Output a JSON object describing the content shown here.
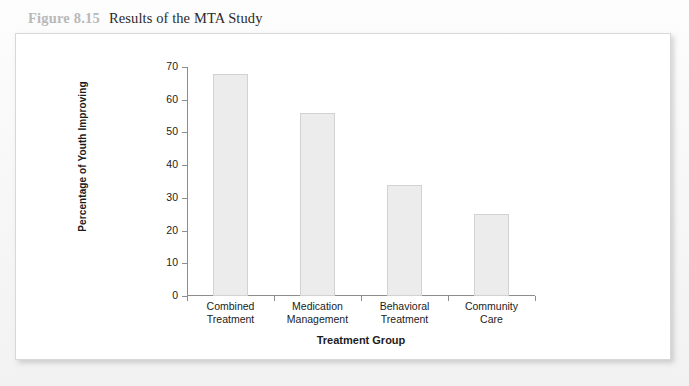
{
  "caption": {
    "number": "Figure 8.15",
    "title": "Results of the MTA Study"
  },
  "chart_data": {
    "type": "bar",
    "title": "Results of the MTA Study",
    "xlabel": "Treatment Group",
    "ylabel": "Percentage of Youth Improving",
    "categories": [
      "Combined Treatment",
      "Medication Management",
      "Behavioral Treatment",
      "Community Care"
    ],
    "category_lines": [
      [
        "Combined",
        "Treatment"
      ],
      [
        "Medication",
        "Management"
      ],
      [
        "Behavioral",
        "Treatment"
      ],
      [
        "Community",
        "Care"
      ]
    ],
    "values": [
      68,
      56,
      34,
      25
    ],
    "ylim": [
      0,
      70
    ],
    "yticks": [
      0,
      10,
      20,
      30,
      40,
      50,
      60,
      70
    ],
    "ytick_labels": [
      "0",
      "10",
      "20",
      "30",
      "40",
      "50",
      "60",
      "70"
    ],
    "grid": false,
    "legend": false,
    "bar_fill": "#ececec",
    "bar_border": "#d2d2d2",
    "axis_color": "#8d8d8d"
  }
}
